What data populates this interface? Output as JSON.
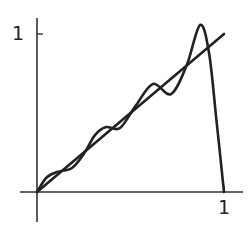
{
  "chart_data": {
    "type": "line",
    "title": "",
    "xlabel": "",
    "ylabel": "",
    "xlim": [
      0,
      1.1
    ],
    "ylim": [
      -0.25,
      1.1
    ],
    "grid": false,
    "legend": null,
    "x_ticks": [
      {
        "value": 1,
        "label": "1"
      }
    ],
    "y_ticks": [
      {
        "value": 1,
        "label": "1"
      }
    ],
    "series": [
      {
        "name": "f(x) = x",
        "x": [
          0,
          1
        ],
        "y": [
          0,
          1
        ]
      },
      {
        "name": "oscillating approximation",
        "x": [
          0,
          0.05,
          0.107,
          0.187,
          0.25,
          0.31,
          0.369,
          0.444,
          0.53,
          0.62,
          0.717,
          0.8,
          0.872,
          0.92,
          0.96,
          1.0
        ],
        "y": [
          0,
          0.09,
          0.127,
          0.152,
          0.24,
          0.36,
          0.411,
          0.405,
          0.55,
          0.684,
          0.62,
          0.8,
          1.057,
          0.88,
          0.45,
          0
        ]
      }
    ],
    "colors": {
      "line": "#222222",
      "axis": "#333333"
    }
  }
}
